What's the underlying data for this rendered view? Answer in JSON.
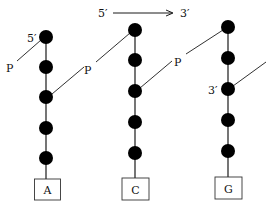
{
  "diagram": {
    "direction_arrow": {
      "start_label": "5′",
      "end_label": "3′"
    },
    "colors": {
      "line": "#1a1a1a",
      "node": "#000000",
      "box_border": "#333333",
      "background": "#ffffff"
    },
    "strands": [
      {
        "base": "A",
        "end_label_5prime": "5′",
        "phosphate_left_label": "P",
        "phosphate_right_label": "P"
      },
      {
        "base": "C",
        "phosphate_right_label": "P"
      },
      {
        "base": "G",
        "end_label_3prime": "3′"
      }
    ]
  }
}
